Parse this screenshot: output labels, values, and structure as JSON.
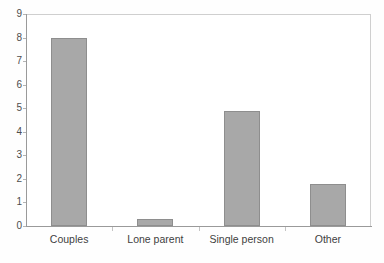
{
  "chart_data": {
    "type": "bar",
    "title": "",
    "subtitle": "",
    "xlabel": "",
    "ylabel": "",
    "categories": [
      "Couples",
      "Lone parent",
      "Single person",
      "Other"
    ],
    "values": [
      8.0,
      0.3,
      4.9,
      1.8
    ],
    "ylim": [
      0,
      9
    ],
    "y_ticks": [
      0,
      1,
      2,
      3,
      4,
      5,
      6,
      7,
      8,
      9
    ],
    "y_tick_labels": [
      "0",
      "1",
      "2",
      "3",
      "4",
      "5",
      "6",
      "7",
      "8",
      "9"
    ],
    "grid": false,
    "legend": null,
    "legend_position": "none",
    "series": [
      {
        "name": "",
        "values": [
          8.0,
          0.3,
          4.9,
          1.8
        ]
      }
    ],
    "annotations": []
  },
  "style": {
    "bar_fill": "#a8a8a8",
    "bar_stroke": "#8e8e8e",
    "axis_color": "#9a9a9a",
    "plot_border_color": "#cfcfcf",
    "tick_color": "#c4c4c4",
    "text_color": "#3f3f3f",
    "ytick_text_color": "#4d4d4d",
    "plot_background": "#ffffff",
    "page_background": "#fefefe"
  }
}
